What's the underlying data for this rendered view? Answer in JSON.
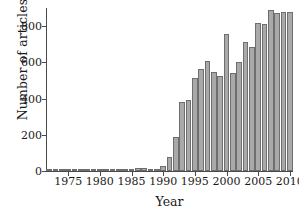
{
  "chart_data": {
    "type": "bar",
    "title": "",
    "xlabel": "Year",
    "ylabel": "Number of articles",
    "xlim": [
      1971.5,
      2010.5
    ],
    "ylim": [
      0,
      900
    ],
    "grid": false,
    "legend": null,
    "ytick_labels": [
      "0",
      "200",
      "400",
      "600",
      "800"
    ],
    "ytick_values": [
      0,
      200,
      400,
      600,
      800
    ],
    "xtick_labels": [
      "1975",
      "1980",
      "1985",
      "1990",
      "1995",
      "2000",
      "2005",
      "2010"
    ],
    "xtick_values": [
      1975,
      1980,
      1985,
      1990,
      1995,
      2000,
      2005,
      2010
    ],
    "categories": [
      1972,
      1973,
      1974,
      1975,
      1976,
      1977,
      1978,
      1979,
      1980,
      1981,
      1982,
      1983,
      1984,
      1985,
      1986,
      1987,
      1988,
      1989,
      1990,
      1991,
      1992,
      1993,
      1994,
      1995,
      1996,
      1997,
      1998,
      1999,
      2000,
      2001,
      2002,
      2003,
      2004,
      2005,
      2006,
      2007,
      2008,
      2009,
      2010
    ],
    "values": [
      2,
      2,
      2,
      3,
      3,
      2,
      3,
      3,
      3,
      3,
      3,
      10,
      10,
      8,
      18,
      16,
      5,
      12,
      25,
      80,
      190,
      380,
      390,
      515,
      565,
      605,
      545,
      525,
      755,
      540,
      600,
      710,
      685,
      820,
      810,
      890,
      870,
      880,
      880
    ],
    "bar_color": "#a9a9a9",
    "bar_edge_color": "#6e6e6e",
    "axis_color": "#4a4a4a",
    "text_color": "#1a1a1a",
    "background_color": "#ffffff"
  }
}
